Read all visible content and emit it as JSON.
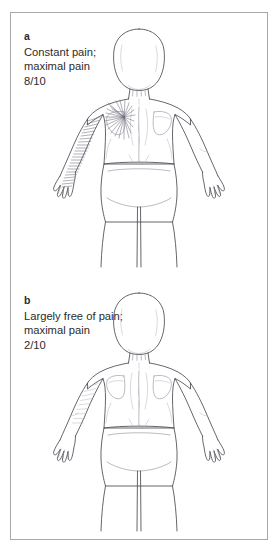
{
  "figure": {
    "name": "pain-drawing-figure",
    "border_color": "#a8a8a8",
    "background_color": "#ffffff",
    "text_color": "#2b2b2b",
    "outline_color": "#4a4a52",
    "detail_color": "#8d8d98",
    "hatch_heavy_color": "#70707c",
    "hatch_light_color": "#b6b6c0"
  },
  "panels": [
    {
      "letter": "a",
      "lines": [
        "Constant pain;",
        "maximal pain",
        "8/10"
      ],
      "body_view": "posterior",
      "pain_region": "left shoulder, scapula and entire left arm to hand",
      "pain_score": "8/10",
      "hatch_density": "heavy"
    },
    {
      "letter": "b",
      "lines": [
        "Largely free of pain;",
        "maximal pain",
        "2/10"
      ],
      "body_view": "posterior",
      "pain_region": "left upper arm only",
      "pain_score": "2/10",
      "hatch_density": "light"
    }
  ]
}
